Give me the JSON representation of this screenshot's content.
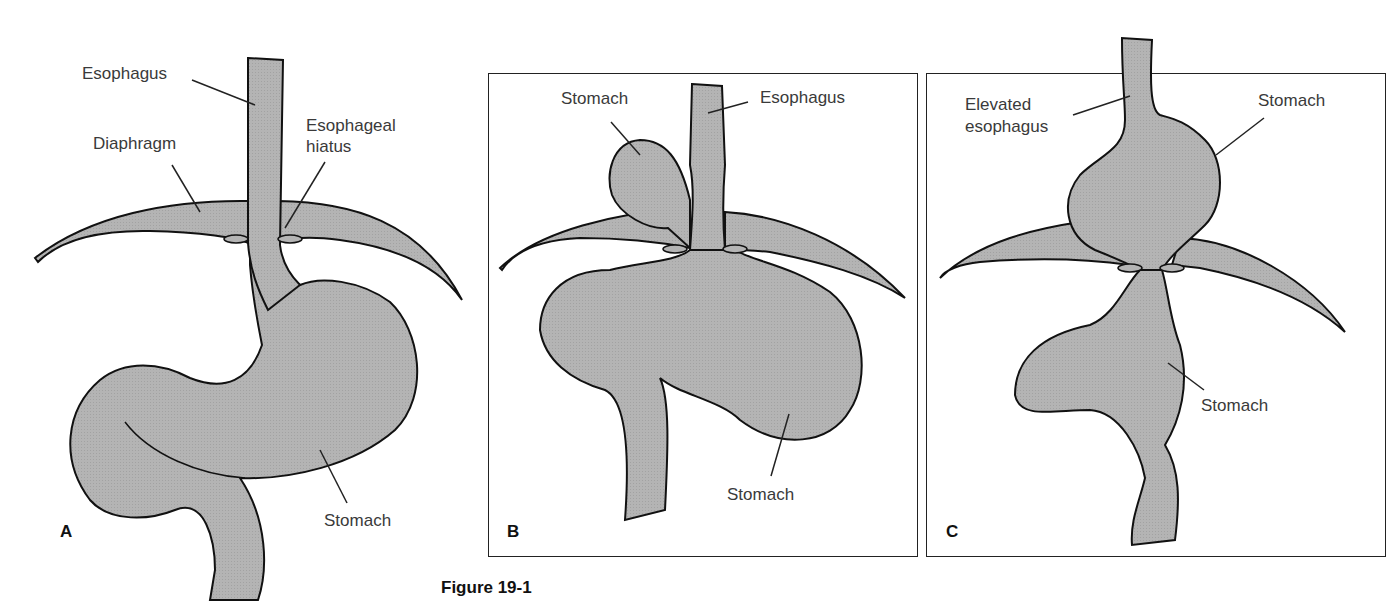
{
  "figure": {
    "caption": "Figure 19-1",
    "fill_color": "#b4b4b4",
    "outline_color": "#111111",
    "panels": [
      {
        "letter": "A",
        "labels": {
          "esophagus": "Esophagus",
          "diaphragm": "Diaphragm",
          "hiatus_line1": "Esophageal",
          "hiatus_line2": "hiatus",
          "stomach": "Stomach"
        }
      },
      {
        "letter": "B",
        "labels": {
          "stomach_top": "Stomach",
          "esophagus": "Esophagus",
          "stomach_bottom": "Stomach"
        }
      },
      {
        "letter": "C",
        "labels": {
          "elevated_line1": "Elevated",
          "elevated_line2": "esophagus",
          "stomach_top": "Stomach",
          "stomach_bottom": "Stomach"
        }
      }
    ]
  }
}
